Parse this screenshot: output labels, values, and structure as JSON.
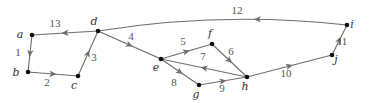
{
  "diagram": {
    "type": "directed-weighted-graph",
    "colors": {
      "edge": "#6d6d6d",
      "node": "#111111",
      "node_label": "#333333",
      "edge_label": "#555555"
    },
    "nodes": [
      {
        "id": "a",
        "label": "a",
        "x": 32,
        "y": 35,
        "lx": 20,
        "ly": 38
      },
      {
        "id": "b",
        "label": "b",
        "x": 28,
        "y": 72,
        "lx": 16,
        "ly": 76
      },
      {
        "id": "c",
        "label": "c",
        "x": 78,
        "y": 76,
        "lx": 74,
        "ly": 89
      },
      {
        "id": "d",
        "label": "d",
        "x": 98,
        "y": 31,
        "lx": 94,
        "ly": 25
      },
      {
        "id": "e",
        "label": "e",
        "x": 161,
        "y": 59,
        "lx": 156,
        "ly": 71
      },
      {
        "id": "f",
        "label": "f",
        "x": 212,
        "y": 44,
        "lx": 210,
        "ly": 37
      },
      {
        "id": "g",
        "label": "g",
        "x": 199,
        "y": 85,
        "lx": 196,
        "ly": 98
      },
      {
        "id": "h",
        "label": "h",
        "x": 247,
        "y": 77,
        "lx": 245,
        "ly": 90
      },
      {
        "id": "i",
        "label": "i",
        "x": 347,
        "y": 25,
        "lx": 352,
        "ly": 28
      },
      {
        "id": "j",
        "label": "j",
        "x": 332,
        "y": 55,
        "lx": 336,
        "ly": 63
      }
    ],
    "edges": [
      {
        "from": "a",
        "to": "b",
        "weight": "1",
        "lx": 18,
        "ly": 56
      },
      {
        "from": "b",
        "to": "c",
        "weight": "2",
        "lx": 47,
        "ly": 86
      },
      {
        "from": "c",
        "to": "d",
        "weight": "3",
        "lx": 94,
        "ly": 61
      },
      {
        "from": "d",
        "to": "e",
        "weight": "4",
        "lx": 131,
        "ly": 40
      },
      {
        "from": "e",
        "to": "f",
        "weight": "5",
        "lx": 183,
        "ly": 45
      },
      {
        "from": "f",
        "to": "h",
        "weight": "6",
        "lx": 231,
        "ly": 55
      },
      {
        "from": "h",
        "to": "e",
        "weight": "7",
        "lx": 203,
        "ly": 60
      },
      {
        "from": "e",
        "to": "g",
        "weight": "8",
        "lx": 174,
        "ly": 86
      },
      {
        "from": "g",
        "to": "h",
        "weight": "9",
        "lx": 222,
        "ly": 92
      },
      {
        "from": "h",
        "to": "j",
        "weight": "10",
        "lx": 286,
        "ly": 77
      },
      {
        "from": "j",
        "to": "i",
        "weight": "11",
        "lx": 342,
        "ly": 45
      },
      {
        "from": "i",
        "to": "d",
        "weight": "12",
        "lx": 237,
        "ly": 14,
        "curved": true
      },
      {
        "from": "d",
        "to": "a",
        "weight": "13",
        "lx": 55,
        "ly": 27
      }
    ]
  }
}
